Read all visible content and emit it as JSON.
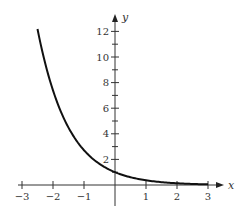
{
  "chart_data": {
    "type": "line",
    "title": "",
    "function": "y = e^(-x)",
    "xlabel": "x",
    "ylabel": "y",
    "xlim": [
      -3,
      3.3
    ],
    "ylim": [
      -1.5,
      13.5
    ],
    "grid": false,
    "legend": null,
    "x_ticks": [
      -3,
      -2,
      -1,
      1,
      2,
      3
    ],
    "x_tick_labels": [
      "−3",
      "−2",
      "−1",
      "1",
      "2",
      "3"
    ],
    "y_ticks": [
      2,
      4,
      6,
      8,
      10,
      12
    ],
    "y_tick_labels": [
      "2",
      "4",
      "6",
      "8",
      "10",
      "12"
    ],
    "y_minor_ticks": [
      1,
      3,
      5,
      7,
      9,
      11
    ],
    "series": [
      {
        "name": "e^(-x)",
        "color": "#111111",
        "x": [
          -2.5,
          -2.25,
          -2.0,
          -1.75,
          -1.5,
          -1.25,
          -1.0,
          -0.75,
          -0.5,
          -0.25,
          0.0,
          0.25,
          0.5,
          0.75,
          1.0,
          1.25,
          1.5,
          1.75,
          2.0,
          2.25,
          2.5,
          2.75,
          3.0
        ],
        "y": [
          12.18,
          9.49,
          7.39,
          5.75,
          4.48,
          3.49,
          2.72,
          2.12,
          1.65,
          1.28,
          1.0,
          0.78,
          0.61,
          0.47,
          0.37,
          0.29,
          0.22,
          0.17,
          0.14,
          0.11,
          0.08,
          0.06,
          0.05
        ]
      }
    ]
  },
  "layout": {
    "origin_px": [
      115,
      185
    ],
    "x_unit_px": 31,
    "y_unit_px": 12.8,
    "x_axis_px": [
      18,
      224
    ],
    "y_axis_px": [
      14,
      206
    ]
  }
}
